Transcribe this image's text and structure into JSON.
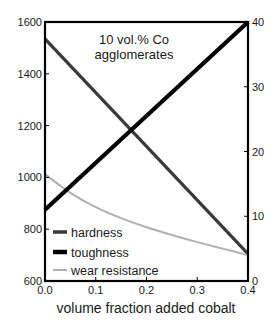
{
  "chart_data": {
    "type": "line",
    "title": "",
    "annotation": [
      "10 vol.% Co",
      "agglomerates"
    ],
    "xlabel": "volume fraction added cobalt",
    "ylabel_left": "",
    "ylabel_right": "",
    "xlim": [
      0.0,
      0.4
    ],
    "ylim_left": [
      600,
      1600
    ],
    "ylim_right": [
      0,
      40
    ],
    "x_ticks": [
      "0.0",
      "0.1",
      "0.2",
      "0.3",
      "0.4"
    ],
    "y_left_ticks": [
      "600",
      "800",
      "1000",
      "1200",
      "1400",
      "1600"
    ],
    "y_right_ticks": [
      "0",
      "10",
      "20",
      "30",
      "40"
    ],
    "grid": false,
    "legend_position": "lower left",
    "series": [
      {
        "name": "hardness",
        "axis": "left",
        "color": "#3a3a3a",
        "x": [
          0.0,
          0.4
        ],
        "values": [
          1535,
          705
        ]
      },
      {
        "name": "toughness",
        "axis": "right",
        "color": "#000000",
        "x": [
          0.0,
          0.4
        ],
        "values": [
          11,
          40
        ]
      },
      {
        "name": "wear resistance",
        "axis": "right",
        "color": "#b0b0b0",
        "x": [
          0.0,
          0.05,
          0.1,
          0.15,
          0.2,
          0.25,
          0.3,
          0.35,
          0.4
        ],
        "values": [
          16.5,
          13.6,
          11.4,
          9.7,
          8.3,
          7.1,
          6.0,
          5.0,
          4.0
        ]
      }
    ]
  },
  "legend": {
    "items": [
      {
        "label": "hardness",
        "color": "#3a3a3a"
      },
      {
        "label": "toughness",
        "color": "#000000"
      },
      {
        "label": "wear resistance",
        "color": "#b0b0b0"
      }
    ]
  }
}
